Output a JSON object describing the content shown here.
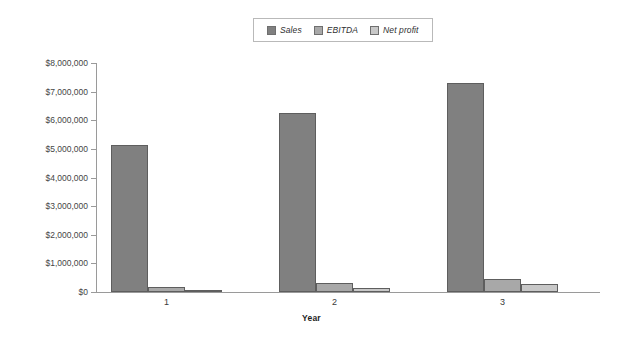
{
  "chart_data": {
    "type": "bar",
    "title": "",
    "xlabel": "Year",
    "ylabel": "",
    "categories": [
      "1",
      "2",
      "3"
    ],
    "series": [
      {
        "name": "Sales",
        "color": "#808080",
        "values": [
          5150000,
          6250000,
          7300000
        ]
      },
      {
        "name": "EBITDA",
        "color": "#a8a8a8",
        "values": [
          170000,
          300000,
          450000
        ]
      },
      {
        "name": "Net profit",
        "color": "#c8c8c8",
        "values": [
          50000,
          130000,
          270000
        ]
      }
    ],
    "ylim": [
      0,
      8000000
    ],
    "ytick_values": [
      0,
      1000000,
      2000000,
      3000000,
      4000000,
      5000000,
      6000000,
      7000000,
      8000000
    ],
    "ytick_labels": [
      "$0",
      "$1,000,000",
      "$2,000,000",
      "$3,000,000",
      "$4,000,000",
      "$5,000,000",
      "$6,000,000",
      "$7,000,000",
      "$8,000,000"
    ],
    "grid": false,
    "legend_position": "top-center"
  },
  "legend": {
    "items": [
      {
        "label": "Sales",
        "color": "#808080"
      },
      {
        "label": "EBITDA",
        "color": "#a8a8a8"
      },
      {
        "label": "Net profit",
        "color": "#c8c8c8"
      }
    ]
  },
  "axes": {
    "x_title": "Year"
  }
}
